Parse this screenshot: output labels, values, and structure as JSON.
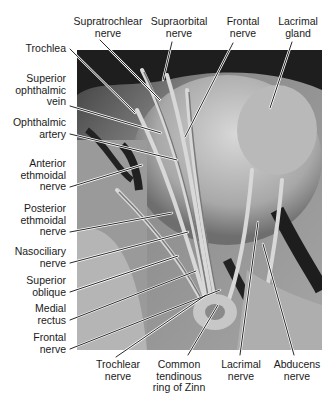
{
  "figure": {
    "photo_tone": "grayscale"
  },
  "labels": {
    "top": [
      {
        "id": "supratrochlear",
        "text": "Supratrochlear\nnerve"
      },
      {
        "id": "supraorbital",
        "text": "Supraorbital\nnerve"
      },
      {
        "id": "frontal_top",
        "text": "Frontal\nnerve"
      },
      {
        "id": "lacrimal_gland",
        "text": "Lacrimal\ngland"
      }
    ],
    "left": [
      {
        "id": "trochlea",
        "text": "Trochlea"
      },
      {
        "id": "sup_ophthalmic_vein",
        "text": "Superior\nophthalmic\nvein"
      },
      {
        "id": "ophthalmic_artery",
        "text": "Ophthalmic\nartery"
      },
      {
        "id": "ant_ethmoidal",
        "text": "Anterior\nethmoidal\nnerve"
      },
      {
        "id": "post_ethmoidal",
        "text": "Posterior\nethmoidal\nnerve"
      },
      {
        "id": "nasociliary",
        "text": "Nasociliary\nnerve"
      },
      {
        "id": "sup_oblique",
        "text": "Superior\noblique"
      },
      {
        "id": "medial_rectus",
        "text": "Medial\nrectus"
      },
      {
        "id": "frontal_left",
        "text": "Frontal\nnerve"
      }
    ],
    "bottom": [
      {
        "id": "trochlear",
        "text": "Trochlear\nnerve"
      },
      {
        "id": "zinn",
        "text": "Common\ntendinous\nring of Zinn"
      },
      {
        "id": "lacrimal_nerve",
        "text": "Lacrimal\nnerve"
      },
      {
        "id": "abducens",
        "text": "Abducens\nnerve"
      }
    ]
  },
  "colors": {
    "leader_line": "#111111",
    "leader_halo": "#ffffff",
    "text": "#1a1a1a"
  }
}
